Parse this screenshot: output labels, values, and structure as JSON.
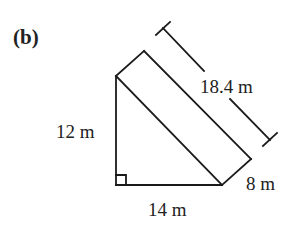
{
  "part_label": "(b)",
  "dimensions": {
    "height": "12 m",
    "base": "14 m",
    "width": "8 m",
    "length": "18.4 m"
  },
  "colors": {
    "stroke": "#1a1a1a",
    "text": "#222222",
    "background": "#ffffff"
  }
}
